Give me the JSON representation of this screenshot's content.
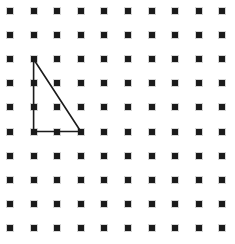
{
  "canvas": {
    "width": 235,
    "height": 244,
    "background_color": "#ffffff",
    "title": "Geoboard dot grid with right triangle"
  },
  "grid": {
    "name": "dot-grid",
    "columns": 10,
    "rows": 10,
    "origin_x": 10,
    "origin_y": 11,
    "spacing_x": 23.6,
    "spacing_y": 24.1,
    "dot_size": 6,
    "dot_color": "#1b1b1b",
    "halo_color": "#bdbdbd"
  },
  "shapes": [
    {
      "name": "right-triangle",
      "type": "polygon",
      "stroke_color": "#1b1b1b",
      "stroke_width": 1.6,
      "fill": "none",
      "vertices_grid": [
        {
          "col": 1,
          "row": 2,
          "label": "apex-top-left"
        },
        {
          "col": 1,
          "row": 5,
          "label": "right-angle-bottom-left"
        },
        {
          "col": 3,
          "row": 5,
          "label": "bottom-right"
        }
      ],
      "vertices_px": [
        {
          "x": 33.6,
          "y": 59.2
        },
        {
          "x": 33.6,
          "y": 131.5
        },
        {
          "x": 80.8,
          "y": 131.5
        }
      ],
      "edges": [
        {
          "name": "vertical-leg",
          "from": 0,
          "to": 1,
          "units": 3
        },
        {
          "name": "horizontal-leg",
          "from": 1,
          "to": 2,
          "units": 2
        },
        {
          "name": "hypotenuse",
          "from": 2,
          "to": 0,
          "units": null
        }
      ]
    }
  ],
  "chart_data": {
    "type": "scatter",
    "xlabel": "",
    "ylabel": "",
    "xlim": [
      0,
      9
    ],
    "ylim": [
      0,
      9
    ],
    "grid": false,
    "legend": "none",
    "series": [
      {
        "name": "grid-pegs",
        "marker": "square",
        "color": "#1b1b1b",
        "x": [
          0,
          1,
          2,
          3,
          4,
          5,
          6,
          7,
          8,
          9,
          0,
          1,
          2,
          3,
          4,
          5,
          6,
          7,
          8,
          9,
          0,
          1,
          2,
          3,
          4,
          5,
          6,
          7,
          8,
          9,
          0,
          1,
          2,
          3,
          4,
          5,
          6,
          7,
          8,
          9,
          0,
          1,
          2,
          3,
          4,
          5,
          6,
          7,
          8,
          9,
          0,
          1,
          2,
          3,
          4,
          5,
          6,
          7,
          8,
          9,
          0,
          1,
          2,
          3,
          4,
          5,
          6,
          7,
          8,
          9,
          0,
          1,
          2,
          3,
          4,
          5,
          6,
          7,
          8,
          9,
          0,
          1,
          2,
          3,
          4,
          5,
          6,
          7,
          8,
          9,
          0,
          1,
          2,
          3,
          4,
          5,
          6,
          7,
          8,
          9
        ],
        "y": [
          0,
          0,
          0,
          0,
          0,
          0,
          0,
          0,
          0,
          0,
          1,
          1,
          1,
          1,
          1,
          1,
          1,
          1,
          1,
          1,
          2,
          2,
          2,
          2,
          2,
          2,
          2,
          2,
          2,
          2,
          3,
          3,
          3,
          3,
          3,
          3,
          3,
          3,
          3,
          3,
          4,
          4,
          4,
          4,
          4,
          4,
          4,
          4,
          4,
          4,
          5,
          5,
          5,
          5,
          5,
          5,
          5,
          5,
          5,
          5,
          6,
          6,
          6,
          6,
          6,
          6,
          6,
          6,
          6,
          6,
          7,
          7,
          7,
          7,
          7,
          7,
          7,
          7,
          7,
          7,
          8,
          8,
          8,
          8,
          8,
          8,
          8,
          8,
          8,
          8,
          9,
          9,
          9,
          9,
          9,
          9,
          9,
          9,
          9,
          9
        ]
      },
      {
        "name": "triangle-outline",
        "marker": "none",
        "color": "#1b1b1b",
        "x": [
          1,
          1,
          3,
          1
        ],
        "y": [
          2,
          5,
          5,
          2
        ]
      }
    ],
    "annotations": []
  }
}
